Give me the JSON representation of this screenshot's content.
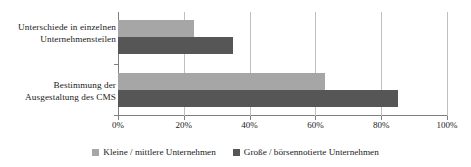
{
  "chart_data": {
    "type": "bar",
    "orientation": "horizontal",
    "title": "",
    "subtitle": "",
    "xlabel": "",
    "ylabel": "",
    "xlim": [
      0,
      100
    ],
    "grid": true,
    "legend_position": "bottom",
    "categories": [
      "Unterschiede in einzelnen Unternehmensteilen",
      "Bestimmung der Ausgestaltung des CMS"
    ],
    "category_lines": [
      [
        "Unterschiede in einzelnen",
        "Unternehmensteilen"
      ],
      [
        "Bestimmung der",
        "Ausgestaltung des CMS"
      ]
    ],
    "series": [
      {
        "name": "Kleine / mittlere Unternehmen",
        "color": "#a6a6a6",
        "values": [
          23,
          63
        ]
      },
      {
        "name": "Große / börsennotierte Unternehmen",
        "color": "#565656",
        "values": [
          35,
          85
        ]
      }
    ],
    "xticks": [
      0,
      20,
      40,
      60,
      80,
      100
    ],
    "xtick_labels": [
      "0%",
      "20%",
      "40%",
      "60%",
      "80%",
      "100%"
    ],
    "axis_color": "#7f7f7f",
    "gridline_color": "#bfbfbf"
  },
  "legend": {
    "items": [
      {
        "label": "Kleine / mittlere Unternehmen",
        "swatch": "legend-swatch-light"
      },
      {
        "label": "Große / börsennotierte Unternehmen",
        "swatch": "legend-swatch-dark"
      }
    ]
  }
}
